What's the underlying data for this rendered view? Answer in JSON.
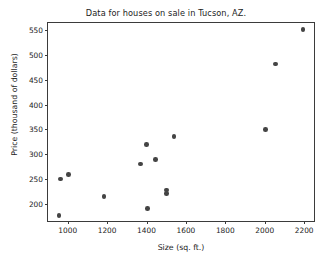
{
  "chart_data": {
    "type": "scatter",
    "title": "Data for houses on sale in Tucson, AZ.",
    "xlabel": "Size (sq. ft.)",
    "ylabel": "Price (thousand of dollars)",
    "xlim": [
      900,
      2250
    ],
    "ylim": [
      165,
      565
    ],
    "grid": false,
    "legend": null,
    "xticks": [
      1000,
      1200,
      1400,
      1600,
      1800,
      2000,
      2200
    ],
    "xtick_labels": [
      "1000",
      "1200",
      "1400",
      "1600",
      "1800",
      "2000",
      "2200"
    ],
    "yticks": [
      200,
      250,
      300,
      350,
      400,
      450,
      500,
      550
    ],
    "ytick_labels": [
      "200",
      "250",
      "300",
      "350",
      "400",
      "450",
      "500",
      "550"
    ],
    "marker_color": "#444444",
    "points": [
      {
        "x": 955,
        "y": 176
      },
      {
        "x": 963,
        "y": 250
      },
      {
        "x": 1005,
        "y": 259
      },
      {
        "x": 1185,
        "y": 215
      },
      {
        "x": 1368,
        "y": 280
      },
      {
        "x": 1400,
        "y": 320
      },
      {
        "x": 1405,
        "y": 190
      },
      {
        "x": 1445,
        "y": 289
      },
      {
        "x": 1500,
        "y": 220
      },
      {
        "x": 1500,
        "y": 228
      },
      {
        "x": 1540,
        "y": 336
      },
      {
        "x": 2005,
        "y": 350
      },
      {
        "x": 2055,
        "y": 482
      },
      {
        "x": 2195,
        "y": 552
      }
    ]
  }
}
